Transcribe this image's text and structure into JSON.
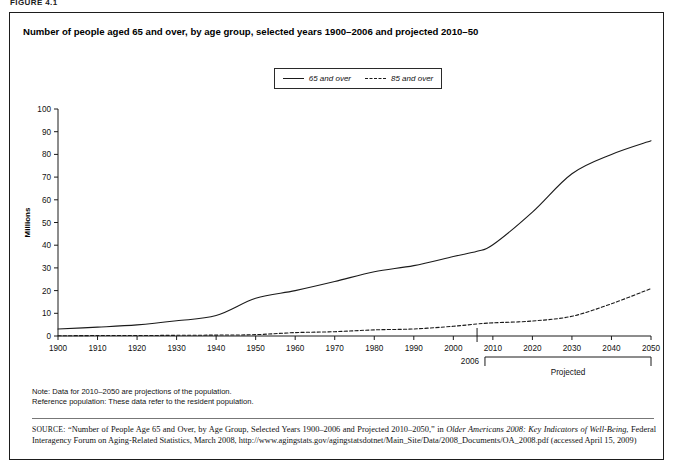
{
  "figure": {
    "label": "FIGURE 4.1",
    "title": "Number of people aged 65 and over, by age group, selected years 1900–2006 and projected 2010–50"
  },
  "legend": {
    "entries": [
      {
        "label": "65 and over",
        "style": "solid"
      },
      {
        "label": "85 and over",
        "style": "dashed"
      }
    ]
  },
  "axis": {
    "y_title": "Millions",
    "y_ticks": [
      "0",
      "10",
      "20",
      "30",
      "40",
      "50",
      "60",
      "70",
      "80",
      "90",
      "100"
    ],
    "x_ticks": [
      "1900",
      "1910",
      "1920",
      "1930",
      "1940",
      "1950",
      "1960",
      "1970",
      "1980",
      "1990",
      "2000",
      "2010",
      "2020",
      "2030",
      "2040",
      "2050"
    ],
    "marker_label": "2006",
    "bracket_label": "Projected"
  },
  "notes": [
    "Note: Data for 2010–2050 are projections of the population.",
    "Reference population: These data refer to the resident population."
  ],
  "source": {
    "kicker": "SOURCE:",
    "text_1": "“Number of People Age 65 and Over, by Age Group, Selected Years 1900–2006 and Projected 2010–2050,” in ",
    "italic_1": "Older Americans 2008: Key Indicators of Well-Being",
    "text_2": ", Federal Interagency Forum on Aging-Related Statistics, March 2008, http://www.agingstats.gov/agingstatsdotnet/Main_Site/Data/2008_Documents/OA_2008.pdf (accessed April 15, 2009)"
  },
  "chart_data": {
    "type": "line",
    "title": "Number of people aged 65 and over, by age group, selected years 1900–2006 and projected 2010–50",
    "xlabel": "",
    "ylabel": "Millions",
    "xlim": [
      1900,
      2050
    ],
    "ylim": [
      0,
      100
    ],
    "grid": false,
    "legend_position": "top-center",
    "x": [
      1900,
      1910,
      1920,
      1930,
      1940,
      1950,
      1960,
      1970,
      1980,
      1990,
      2000,
      2006,
      2010,
      2020,
      2030,
      2040,
      2050
    ],
    "series": [
      {
        "name": "65 and over",
        "style": "solid",
        "color": "#1a1a1a",
        "values": [
          3.1,
          3.9,
          4.9,
          6.7,
          9.0,
          16.6,
          20.0,
          24.0,
          28.3,
          31.0,
          35.0,
          37.3,
          40.2,
          54.6,
          71.5,
          80.0,
          86.0
        ]
      },
      {
        "name": "85 and over",
        "style": "dashed",
        "color": "#1a1a1a",
        "values": [
          0.1,
          0.2,
          0.2,
          0.3,
          0.4,
          0.6,
          1.5,
          1.9,
          2.7,
          3.1,
          4.3,
          5.3,
          5.8,
          6.6,
          8.7,
          14.2,
          20.9
        ]
      }
    ],
    "annotations": [
      {
        "text": "2006",
        "x": 2006,
        "type": "axis-marker"
      },
      {
        "text": "Projected",
        "x_range": [
          2008,
          2050
        ],
        "type": "bracket"
      }
    ]
  }
}
